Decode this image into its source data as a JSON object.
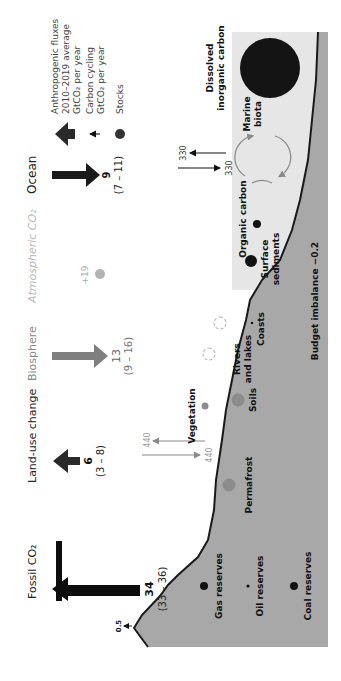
{
  "figure": {
    "orientation": "rotated -90 degrees (text reads bottom-to-top)",
    "colors": {
      "land": "#a8a8a8",
      "ocean": "#e6e6e6",
      "coastline": "#1a1a1a",
      "dark_stock": "#141414",
      "mid_stock": "#8c8c8c",
      "light_label": "#b0b0b0",
      "biosphere_arrow": "#7f7f7f",
      "cycling_arrow_grey": "#9a9a9a",
      "fossil_arrow": "#0d0d0d"
    },
    "columns": [
      {
        "id": "fossil",
        "label": "Fossil CO₂",
        "value": "34",
        "range": "(33 – 36)",
        "direction": "up"
      },
      {
        "id": "landuse",
        "label": "Land-use change",
        "value": "6",
        "range": "(3 – 8)",
        "direction": "up"
      },
      {
        "id": "biosphere",
        "label": "Biosphere",
        "value": "13",
        "range": "(9 – 16)",
        "direction": "down"
      },
      {
        "id": "atmos",
        "label": "Atmospheric CO₂",
        "value": "+19"
      },
      {
        "id": "ocean",
        "label": "Ocean",
        "value": "9",
        "range": "(7 – 11)",
        "direction": "down"
      }
    ],
    "legend": {
      "anthropogenic": [
        "Anthropogenic fluxes",
        "2010–2019 average",
        "GtCO₂ per year"
      ],
      "cycling": [
        "Carbon cycling",
        "GtCO₂ per year"
      ],
      "stocks": "Stocks"
    },
    "cycling_fluxes": {
      "land_up": "440",
      "land_down": "440",
      "ocean_up": "330",
      "ocean_down": "330",
      "volcanic": "0.5"
    },
    "stocks": {
      "gas": "Gas reserves",
      "oil": "Oil reserves",
      "coal": "Coal reserves",
      "permafrost": "Permafrost",
      "soils": "Soils",
      "vegetation": "Vegetation",
      "rivers": [
        "Rivers",
        "and lakes"
      ],
      "coasts": "Coasts",
      "surface_sediments": [
        "Surface",
        "sediments"
      ],
      "organic_carbon": "Organic carbon",
      "marine_biota": [
        "Marine",
        "biota"
      ],
      "dic": [
        "Dissolved",
        "inorganic carbon"
      ]
    },
    "budget_imbalance": "Budget imbalance −0.2"
  }
}
